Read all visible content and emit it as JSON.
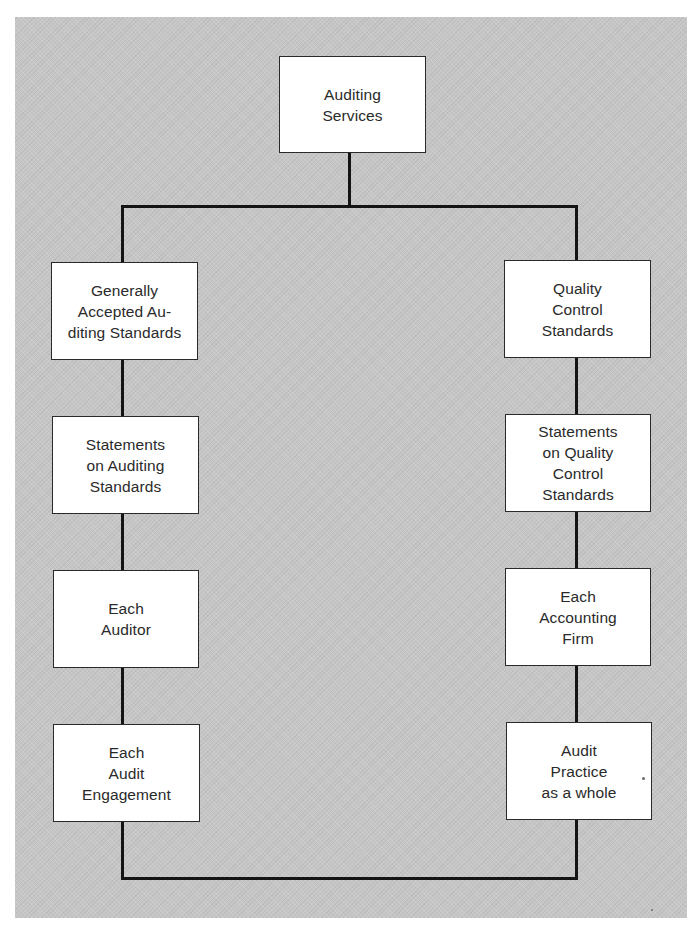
{
  "diagram": {
    "type": "hierarchy",
    "colors": {
      "background": "#c6c6c6",
      "box_fill": "#ffffff",
      "line": "#141414",
      "text": "#2a2a2a"
    },
    "root": {
      "label": "Auditing\nServices"
    },
    "left_branch": [
      {
        "label": "Generally\nAccepted Au-\nditing Standards"
      },
      {
        "label": "Statements\non Auditing\nStandards"
      },
      {
        "label": "Each\nAuditor"
      },
      {
        "label": "Each\nAudit\nEngagement"
      }
    ],
    "right_branch": [
      {
        "label": "Quality\nControl\nStandards"
      },
      {
        "label": "Statements\non Quality\nControl\nStandards"
      },
      {
        "label": "Each\nAccounting\nFirm"
      },
      {
        "label": "Audit\nPractice\nas a whole"
      }
    ],
    "connections": [
      {
        "from": "Auditing Services",
        "to": "Generally Accepted Auditing Standards"
      },
      {
        "from": "Auditing Services",
        "to": "Quality Control Standards"
      },
      {
        "from": "Generally Accepted Auditing Standards",
        "to": "Statements on Auditing Standards"
      },
      {
        "from": "Statements on Auditing Standards",
        "to": "Each Auditor"
      },
      {
        "from": "Each Auditor",
        "to": "Each Audit Engagement"
      },
      {
        "from": "Quality Control Standards",
        "to": "Statements on Quality Control Standards"
      },
      {
        "from": "Statements on Quality Control Standards",
        "to": "Each Accounting Firm"
      },
      {
        "from": "Each Accounting Firm",
        "to": "Audit Practice as a whole"
      },
      {
        "from": "Each Audit Engagement",
        "to": "Audit Practice as a whole"
      }
    ]
  }
}
